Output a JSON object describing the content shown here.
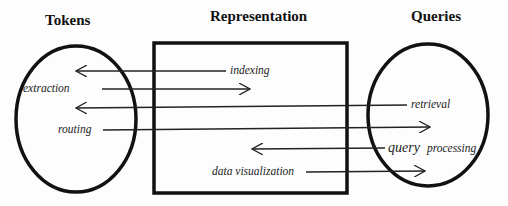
{
  "diagram": {
    "titles": {
      "left": "Tokens",
      "center": "Representation",
      "right": "Queries"
    },
    "nodes": [
      {
        "id": "tokens",
        "shape": "ellipse",
        "label": "Tokens"
      },
      {
        "id": "representation",
        "shape": "rectangle",
        "label": "Representation"
      },
      {
        "id": "queries",
        "shape": "ellipse",
        "label": "Queries"
      }
    ],
    "edges": [
      {
        "label": "indexing",
        "direction": "left",
        "from": "representation",
        "to": "tokens"
      },
      {
        "label": "extraction",
        "direction": "right",
        "from": "tokens",
        "to": "representation"
      },
      {
        "label": "retrieval",
        "direction": "left",
        "from": "queries",
        "to": "tokens"
      },
      {
        "label": "routing",
        "direction": "right",
        "from": "tokens",
        "to": "queries"
      },
      {
        "label_part1": "query",
        "label_part2": "processing",
        "label": "query processing",
        "direction": "left",
        "from": "queries",
        "to": "representation"
      },
      {
        "label": "data visualization",
        "direction": "right",
        "from": "representation",
        "to": "queries"
      }
    ]
  }
}
